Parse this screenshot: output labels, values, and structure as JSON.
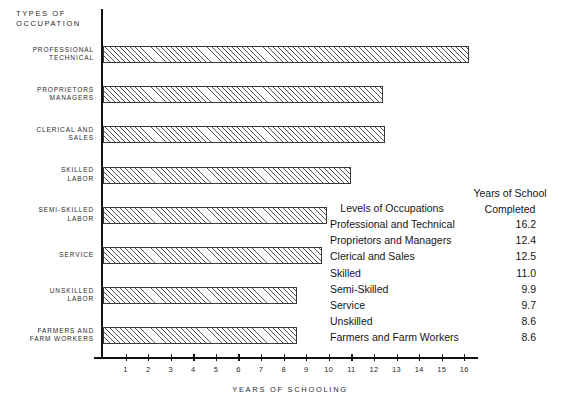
{
  "chart_data": {
    "type": "bar",
    "orientation": "horizontal",
    "title": "",
    "xlabel": "YEARS OF SCHOOLING",
    "ylabel": "TYPES OF\nOCCUPATION",
    "xlim": [
      0,
      17
    ],
    "grid": false,
    "legend": "none",
    "categories": [
      "PROFESSIONAL\nTECHNICAL",
      "PROPRIETORS\nMANAGERS",
      "CLERICAL AND\nSALES",
      "SKILLED\nLABOR",
      "SEMI-SKILLED\nLABOR",
      "SERVICE",
      "UNSKILLED\nLABOR",
      "FARMERS AND\nFARM WORKERS"
    ],
    "values": [
      16.2,
      12.4,
      12.5,
      11.0,
      9.9,
      9.7,
      8.6,
      8.6
    ],
    "xticks": [
      1,
      2,
      3,
      4,
      5,
      6,
      7,
      8,
      9,
      10,
      11,
      12,
      13,
      14,
      15,
      16
    ]
  },
  "axes": {
    "y_axis_title": "TYPES OF\nOCCUPATION",
    "x_axis_title": "YEARS OF SCHOOLING"
  },
  "legend_table": {
    "header_left": "Levels of Occupations",
    "header_right": "Years of School\nCompleted",
    "rows": [
      {
        "level": "Professional and Technical",
        "years": "16.2"
      },
      {
        "level": "Proprietors and Managers",
        "years": "12.4"
      },
      {
        "level": "Clerical and Sales",
        "years": "12.5"
      },
      {
        "level": "Skilled",
        "years": "11.0"
      },
      {
        "level": "Semi-Skilled",
        "years": "9.9"
      },
      {
        "level": "Service",
        "years": "9.7"
      },
      {
        "level": "Unskilled",
        "years": "8.6"
      },
      {
        "level": "Farmers and Farm Workers",
        "years": "8.6"
      }
    ]
  },
  "colors": {
    "ink": "#111111",
    "text": "#2a2a2a",
    "hatch": "#555555",
    "background": "#ffffff"
  }
}
